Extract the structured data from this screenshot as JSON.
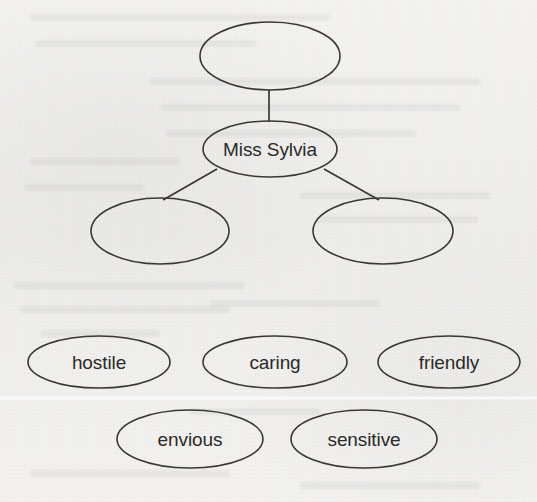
{
  "document": {
    "kind": "hand-drawn concept map (scanned textbook page)",
    "background_color": "#f2f1ef",
    "ink_color": "#3a3836",
    "text_color": "#2b2a28"
  },
  "concept_map": {
    "nodes": [
      {
        "id": "top",
        "label": "",
        "cx": 270,
        "cy": 56,
        "rx": 70,
        "ry": 34
      },
      {
        "id": "center",
        "label": "Miss Sylvia",
        "cx": 270,
        "cy": 149,
        "rx": 67,
        "ry": 28
      },
      {
        "id": "left",
        "label": "",
        "cx": 160,
        "cy": 231,
        "rx": 69,
        "ry": 33
      },
      {
        "id": "right",
        "label": "",
        "cx": 383,
        "cy": 231,
        "rx": 70,
        "ry": 33
      }
    ],
    "edges": [
      {
        "from": "top",
        "to": "center",
        "x1": 269,
        "y1": 90,
        "x2": 269,
        "y2": 122
      },
      {
        "from": "center",
        "to": "left",
        "x1": 217,
        "y1": 169,
        "x2": 163,
        "y2": 200
      },
      {
        "from": "center",
        "to": "right",
        "x1": 324,
        "y1": 169,
        "x2": 379,
        "y2": 200
      }
    ]
  },
  "word_bank": {
    "row_one": [
      {
        "label": "hostile",
        "cx": 99,
        "cy": 362,
        "rx": 71,
        "ry": 26
      },
      {
        "label": "caring",
        "cx": 275,
        "cy": 362,
        "rx": 72,
        "ry": 26
      },
      {
        "label": "friendly",
        "cx": 449,
        "cy": 362,
        "rx": 71,
        "ry": 26
      }
    ],
    "row_two": [
      {
        "label": "envious",
        "cx": 190,
        "cy": 439,
        "rx": 73,
        "ry": 29
      },
      {
        "label": "sensitive",
        "cx": 364,
        "cy": 439,
        "rx": 73,
        "ry": 29
      }
    ]
  },
  "ghost_text_lines": [
    {
      "x": 30,
      "y": 14,
      "w": 300
    },
    {
      "x": 36,
      "y": 40,
      "w": 220
    },
    {
      "x": 150,
      "y": 78,
      "w": 330
    },
    {
      "x": 160,
      "y": 104,
      "w": 300
    },
    {
      "x": 166,
      "y": 130,
      "w": 250
    },
    {
      "x": 30,
      "y": 158,
      "w": 150
    },
    {
      "x": 24,
      "y": 184,
      "w": 120
    },
    {
      "x": 300,
      "y": 192,
      "w": 190
    },
    {
      "x": 318,
      "y": 216,
      "w": 160
    },
    {
      "x": 14,
      "y": 282,
      "w": 230
    },
    {
      "x": 20,
      "y": 306,
      "w": 210
    },
    {
      "x": 210,
      "y": 300,
      "w": 170
    },
    {
      "x": 40,
      "y": 330,
      "w": 120
    },
    {
      "x": 190,
      "y": 408,
      "w": 130
    },
    {
      "x": 30,
      "y": 470,
      "w": 200
    },
    {
      "x": 300,
      "y": 482,
      "w": 180
    }
  ]
}
